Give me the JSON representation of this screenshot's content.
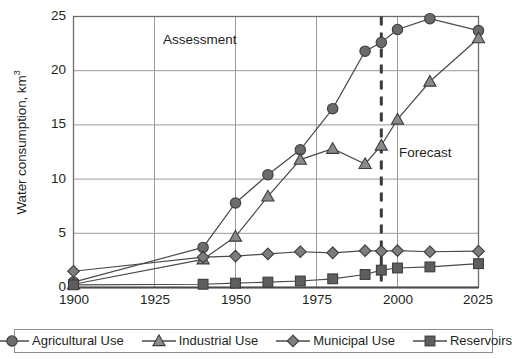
{
  "chart_data": {
    "type": "line",
    "title": "",
    "xlabel": "",
    "ylabel": "Water consumption, km3",
    "ylabel_base": "Water consumption, km",
    "ylabel_exponent": "3",
    "xlim": [
      1900,
      2025
    ],
    "ylim": [
      0,
      25
    ],
    "x_ticks": [
      1900,
      1925,
      1950,
      1975,
      2000,
      2025
    ],
    "y_ticks": [
      0,
      5,
      10,
      15,
      20,
      25
    ],
    "grid": true,
    "legend_position": "bottom",
    "x": [
      1900,
      1940,
      1950,
      1960,
      1970,
      1980,
      1990,
      1995,
      2000,
      2010,
      2025
    ],
    "series": [
      {
        "name": "Agricultural Use",
        "marker": "circle",
        "color": "#6b6b6b",
        "values": [
          0.5,
          3.7,
          7.8,
          10.4,
          12.7,
          16.5,
          21.8,
          22.6,
          23.8,
          24.8,
          23.7
        ]
      },
      {
        "name": "Industrial Use",
        "marker": "triangle",
        "color": "#8a8a8a",
        "values": [
          0.3,
          2.6,
          4.7,
          8.4,
          11.8,
          12.8,
          11.4,
          13.1,
          15.5,
          19.0,
          23.0
        ]
      },
      {
        "name": "Municipal Use",
        "marker": "diamond",
        "color": "#7d7d7d",
        "values": [
          1.5,
          2.8,
          2.9,
          3.1,
          3.3,
          3.2,
          3.4,
          3.35,
          3.4,
          3.3,
          3.35
        ]
      },
      {
        "name": "Reservoirs",
        "marker": "square",
        "color": "#5e5e5e",
        "values": [
          0.25,
          0.3,
          0.4,
          0.5,
          0.6,
          0.8,
          1.2,
          1.6,
          1.8,
          1.9,
          2.2
        ]
      }
    ],
    "annotations": [
      {
        "text": "Assessment",
        "x": 1952,
        "y": 23.4
      },
      {
        "text": "Forecast",
        "x": 2011,
        "y": 13.2
      }
    ],
    "divider": {
      "x": 1995,
      "style": "dashed",
      "color": "#3a3a3a"
    }
  },
  "legend": {
    "items": [
      {
        "label": "Agricultural Use",
        "marker": "circle"
      },
      {
        "label": "Industrial Use",
        "marker": "triangle"
      },
      {
        "label": "Municipal Use",
        "marker": "diamond"
      },
      {
        "label": "Reservoirs",
        "marker": "square"
      }
    ]
  },
  "axes": {
    "y_tick_labels": [
      "0",
      "5",
      "10",
      "15",
      "20",
      "25"
    ],
    "x_tick_labels": [
      "1900",
      "1925",
      "1950",
      "1975",
      "2000",
      "2025"
    ]
  },
  "colors": {
    "axis": "#6d6d6d",
    "grid": "#9a9a9a",
    "text": "#231f20",
    "divider": "#3a3a3a",
    "legend_border": "#8d8d8d"
  }
}
